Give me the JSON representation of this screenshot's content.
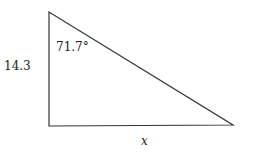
{
  "diagram": {
    "type": "right-triangle",
    "vertices": {
      "top": [
        49,
        12
      ],
      "right_angle": [
        49,
        126
      ],
      "right": [
        233,
        125
      ]
    },
    "labels": {
      "vertical_side": "14.3",
      "angle": "71.7°",
      "horizontal_side": "x"
    },
    "stroke_color": "#333333"
  }
}
